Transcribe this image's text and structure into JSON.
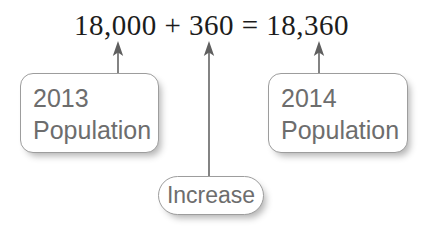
{
  "diagram": {
    "equation": "18,000 + 360 = 18,360",
    "boxes": [
      {
        "id": "box-2013",
        "line1": "2013",
        "line2": "Population"
      },
      {
        "id": "box-2014",
        "line1": "2014",
        "line2": "Population"
      },
      {
        "id": "box-increase",
        "line1": "Increase"
      }
    ],
    "colors": {
      "background": "#ffffff",
      "equation_text": "#1c1c1c",
      "box_text": "#6d6d6d",
      "box_border": "#9d9d9d",
      "box_fill": "#ffffff",
      "arrow": "#6e6e6e"
    },
    "arrows": [
      {
        "name": "arrow-2013-to-18000",
        "from": "box-2013",
        "to": "18,000"
      },
      {
        "name": "arrow-increase-to-360",
        "from": "box-increase",
        "to": "360"
      },
      {
        "name": "arrow-2014-to-18360",
        "from": "box-2014",
        "to": "18,360"
      }
    ]
  }
}
